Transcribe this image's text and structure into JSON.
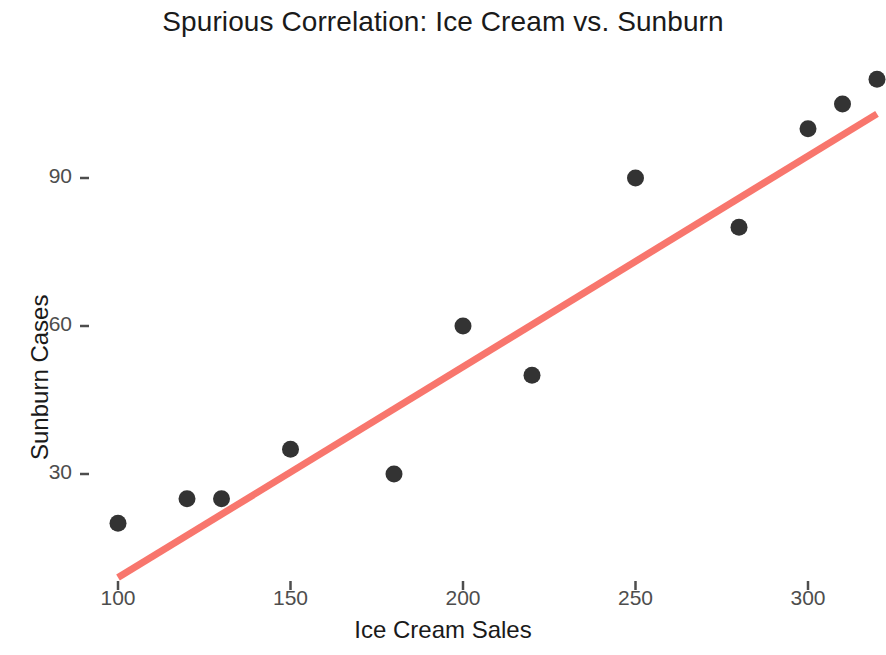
{
  "chart_data": {
    "type": "scatter",
    "title": "Spurious Correlation: Ice Cream vs. Sunburn",
    "xlabel": "Ice Cream Sales",
    "ylabel": "Sunburn Cases",
    "x": [
      100,
      120,
      130,
      150,
      180,
      200,
      220,
      250,
      280,
      300,
      310,
      320
    ],
    "values": [
      20,
      25,
      25,
      35,
      30,
      60,
      50,
      90,
      80,
      100,
      105,
      110
    ],
    "series": [
      {
        "name": "observations",
        "points": [
          {
            "x": 100,
            "y": 20
          },
          {
            "x": 120,
            "y": 25
          },
          {
            "x": 130,
            "y": 25
          },
          {
            "x": 150,
            "y": 35
          },
          {
            "x": 180,
            "y": 30
          },
          {
            "x": 200,
            "y": 60
          },
          {
            "x": 220,
            "y": 50
          },
          {
            "x": 250,
            "y": 90
          },
          {
            "x": 280,
            "y": 80
          },
          {
            "x": 300,
            "y": 100
          },
          {
            "x": 310,
            "y": 105
          },
          {
            "x": 320,
            "y": 110
          }
        ],
        "marker_color": "#333333",
        "marker_size": 9
      }
    ],
    "trendline": {
      "name": "linear fit",
      "color": "#F8766D",
      "width": 7,
      "x_start": 100,
      "y_start": 9,
      "x_end": 320,
      "y_end": 103
    },
    "xticks": [
      100,
      150,
      200,
      250,
      300
    ],
    "xtick_labels": [
      "100",
      "150",
      "200",
      "250",
      "300"
    ],
    "yticks": [
      30,
      60,
      90
    ],
    "ytick_labels": [
      "30",
      "60",
      "90"
    ],
    "xlim": [
      88,
      332
    ],
    "ylim": [
      5,
      118
    ],
    "grid": false,
    "legend": false,
    "legend_position": "none",
    "background": "#ffffff"
  },
  "colors": {
    "trendline": "#F8766D",
    "marker": "#333333",
    "title_text": "#1a1a1a",
    "tick_text": "#4d4d4d",
    "background": "#ffffff"
  }
}
